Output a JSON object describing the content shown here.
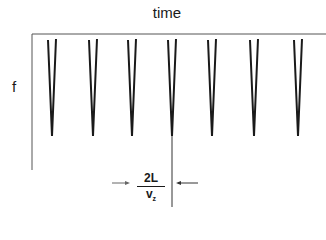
{
  "title": "time",
  "y_label": "f",
  "period_label": {
    "numerator": "2L",
    "denominator": "v",
    "subscript": "z"
  },
  "colors": {
    "line": "#1a1a1a",
    "axis": "#555555",
    "background": "#ffffff"
  },
  "spikes": [
    {
      "x": 52
    },
    {
      "x": 93
    },
    {
      "x": 132
    },
    {
      "x": 172
    },
    {
      "x": 212
    },
    {
      "x": 254
    },
    {
      "x": 298
    }
  ]
}
